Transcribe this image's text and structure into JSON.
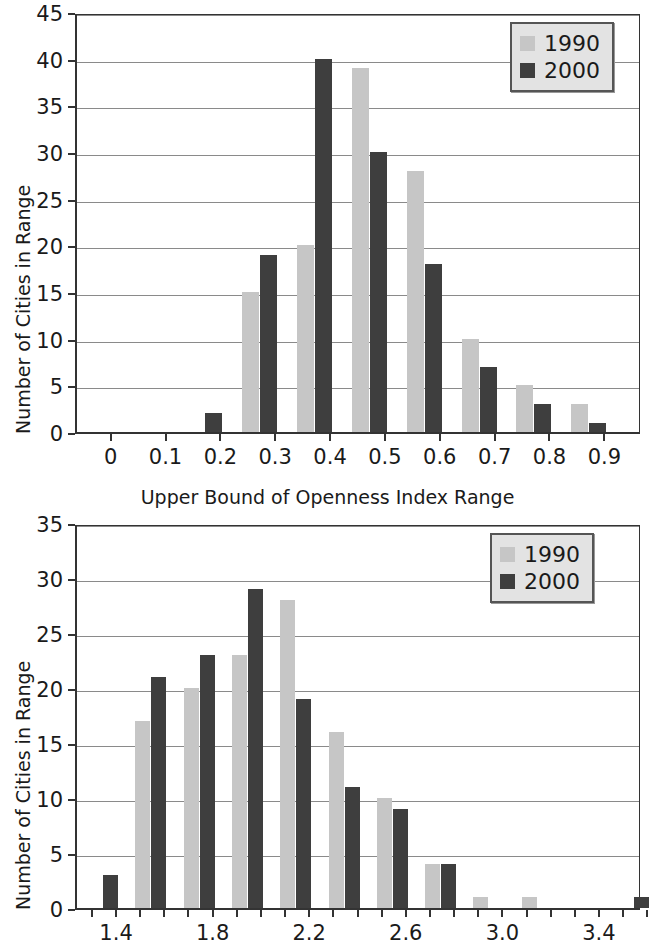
{
  "charts": [
    {
      "id": "openness-index-histogram",
      "ylabel": "Number of Cities in Range",
      "xlabel": "Upper Bound of Openness Index Range",
      "legend": {
        "items": [
          {
            "label": "1990",
            "color": "#c6c6c6"
          },
          {
            "label": "2000",
            "color": "#3e3e3e"
          }
        ]
      },
      "yticks": [
        "0",
        "5",
        "10",
        "15",
        "20",
        "25",
        "30",
        "35",
        "40",
        "45"
      ],
      "xticks": [
        "0",
        "0.1",
        "0.2",
        "0.3",
        "0.4",
        "0.5",
        "0.6",
        "0.7",
        "0.8",
        "0.9"
      ]
    },
    {
      "id": "secondary-index-histogram",
      "ylabel": "Number of Cities in Range",
      "xlabel": "",
      "legend": {
        "items": [
          {
            "label": "1990",
            "color": "#c6c6c6"
          },
          {
            "label": "2000",
            "color": "#3e3e3e"
          }
        ]
      },
      "yticks": [
        "0",
        "5",
        "10",
        "15",
        "20",
        "25",
        "30",
        "35"
      ],
      "xticks": [
        "1.4",
        "1.8",
        "2.2",
        "2.6",
        "3.0",
        "3.4"
      ]
    }
  ],
  "chart_data": [
    {
      "type": "bar",
      "title": "",
      "xlabel": "Upper Bound of Openness Index Range",
      "ylabel": "Number of Cities in Range",
      "categories": [
        "0",
        "0.1",
        "0.2",
        "0.3",
        "0.4",
        "0.5",
        "0.6",
        "0.7",
        "0.8",
        "0.9"
      ],
      "series": [
        {
          "name": "1990",
          "color": "#c6c6c6",
          "values": [
            0,
            0,
            0,
            15,
            20,
            39,
            28,
            10,
            5,
            3
          ]
        },
        {
          "name": "2000",
          "color": "#3e3e3e",
          "values": [
            0,
            0,
            2,
            19,
            40,
            30,
            18,
            7,
            3,
            1
          ]
        }
      ],
      "ylim": [
        0,
        45
      ],
      "ytick_step": 5,
      "xlim": [
        -0.05,
        0.95
      ],
      "grid": true,
      "legend_position": "top-right"
    },
    {
      "type": "bar",
      "title": "",
      "xlabel": "",
      "ylabel": "Number of Cities in Range",
      "categories": [
        "1.4",
        "1.5",
        "1.6",
        "1.7",
        "1.8",
        "1.9",
        "2.0",
        "2.1",
        "2.2",
        "2.3",
        "2.4",
        "2.5",
        "2.6",
        "2.7",
        "2.8",
        "2.9",
        "3.0",
        "3.1",
        "3.2",
        "3.3",
        "3.4",
        "3.5"
      ],
      "series": [
        {
          "name": "1990",
          "color": "#c6c6c6",
          "values": [
            0,
            17,
            20,
            23,
            28,
            16,
            10,
            4,
            1,
            1,
            0,
            0
          ]
        },
        {
          "name": "2000",
          "color": "#3e3e3e",
          "values": [
            3,
            21,
            23,
            29,
            19,
            11,
            9,
            4,
            0,
            0,
            0,
            1
          ]
        }
      ],
      "bin_labels": [
        "1.4",
        "1.6",
        "1.8",
        "2.0",
        "2.2",
        "2.4",
        "2.6",
        "2.8",
        "3.0",
        "3.2",
        "3.4",
        "3.6"
      ],
      "ylim": [
        0,
        35
      ],
      "ytick_step": 5,
      "xlim": [
        1.3,
        3.6
      ],
      "xtick_labels": [
        "1.4",
        "1.8",
        "2.2",
        "2.6",
        "3.0",
        "3.4"
      ],
      "grid": true,
      "legend_position": "top-right"
    }
  ]
}
